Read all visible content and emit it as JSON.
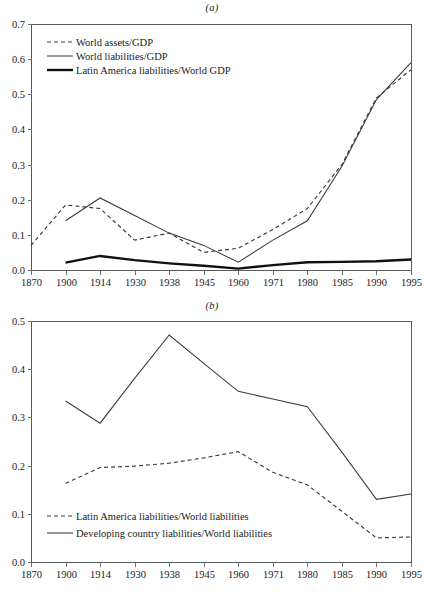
{
  "figure": {
    "panel_a_label": "(a)",
    "panel_b_label": "(b)"
  },
  "chart_data": [
    {
      "id": "panel-a",
      "type": "line",
      "title": "(a)",
      "xlabel": "",
      "ylabel": "",
      "grid": false,
      "legend_position": "top-left",
      "x": [
        "1870",
        "1900",
        "1914",
        "1930",
        "1938",
        "1945",
        "1960",
        "1971",
        "1980",
        "1985",
        "1990",
        "1995"
      ],
      "xtick_labels": [
        "1870",
        "1900",
        "1914",
        "1930",
        "1938",
        "1945",
        "1960",
        "1971",
        "1980",
        "1985",
        "1990",
        "1995"
      ],
      "ytick_labels": [
        "0.0",
        "0.1",
        "0.2",
        "0.3",
        "0.4",
        "0.5",
        "0.6",
        "0.7"
      ],
      "ylim": [
        0.0,
        0.7
      ],
      "series": [
        {
          "name": "World assets/GDP",
          "style": "dashed",
          "values": [
            0.07,
            0.185,
            0.175,
            0.085,
            0.105,
            0.05,
            0.062,
            0.115,
            0.175,
            0.3,
            0.49,
            0.57
          ]
        },
        {
          "name": "World liabilities/GDP",
          "style": "thin-solid",
          "values": [
            null,
            0.14,
            0.205,
            0.155,
            0.105,
            0.07,
            0.022,
            0.085,
            0.14,
            0.295,
            0.485,
            0.59
          ]
        },
        {
          "name": "Latin America liabilities/World GDP",
          "style": "thick-solid",
          "values": [
            null,
            0.021,
            0.04,
            0.028,
            0.019,
            0.012,
            0.004,
            0.014,
            0.022,
            0.023,
            0.025,
            0.03
          ]
        }
      ]
    },
    {
      "id": "panel-b",
      "type": "line",
      "title": "(b)",
      "xlabel": "",
      "ylabel": "",
      "grid": false,
      "legend_position": "bottom-left",
      "x": [
        "1870",
        "1900",
        "1914",
        "1930",
        "1938",
        "1945",
        "1960",
        "1971",
        "1980",
        "1985",
        "1990",
        "1995"
      ],
      "xtick_labels": [
        "1870",
        "1900",
        "1914",
        "1930",
        "1938",
        "1945",
        "1960",
        "1971",
        "1980",
        "1985",
        "1990",
        "1995"
      ],
      "ytick_labels": [
        "0.0",
        "0.1",
        "0.2",
        "0.3",
        "0.4",
        "0.5"
      ],
      "ylim": [
        0.0,
        0.5
      ],
      "series": [
        {
          "name": "Latin America liabilities/World liabilities",
          "style": "dashed",
          "values": [
            null,
            0.163,
            0.196,
            0.199,
            0.205,
            0.216,
            0.229,
            0.186,
            0.16,
            0.105,
            0.05,
            0.052
          ]
        },
        {
          "name": "Developing country liabilities/World liabilities",
          "style": "thin-solid",
          "values": [
            null,
            0.334,
            0.288,
            0.381,
            0.471,
            0.412,
            0.354,
            0.338,
            0.322,
            0.228,
            0.13,
            0.141
          ]
        }
      ]
    }
  ]
}
